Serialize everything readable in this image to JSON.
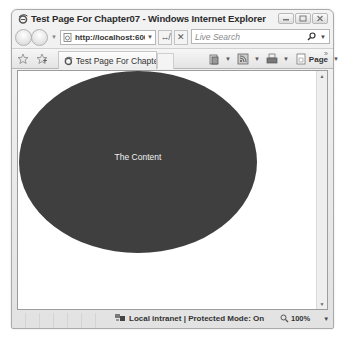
{
  "window": {
    "title": "Test Page For Chapter07 - Windows Internet Explorer",
    "caption_buttons": [
      "minimize",
      "maximize",
      "close"
    ]
  },
  "navbar": {
    "address": "http://localhost:600(",
    "search_placeholder": "Live Search"
  },
  "commandbar": {
    "tab_title": "Test Page For Chapter...",
    "page_label": "Page",
    "more_glyph": "»"
  },
  "content": {
    "ellipse_text": "The Content",
    "ellipse_color": "#3f3f3f"
  },
  "statusbar": {
    "zone_text": "Local intranet | Protected Mode: On",
    "zoom_level": "100%"
  },
  "glyphs": {
    "dropdown": "▼",
    "refresh": "↮",
    "stop": "✕",
    "scroll_up": "▲",
    "scroll_down": "▼"
  }
}
